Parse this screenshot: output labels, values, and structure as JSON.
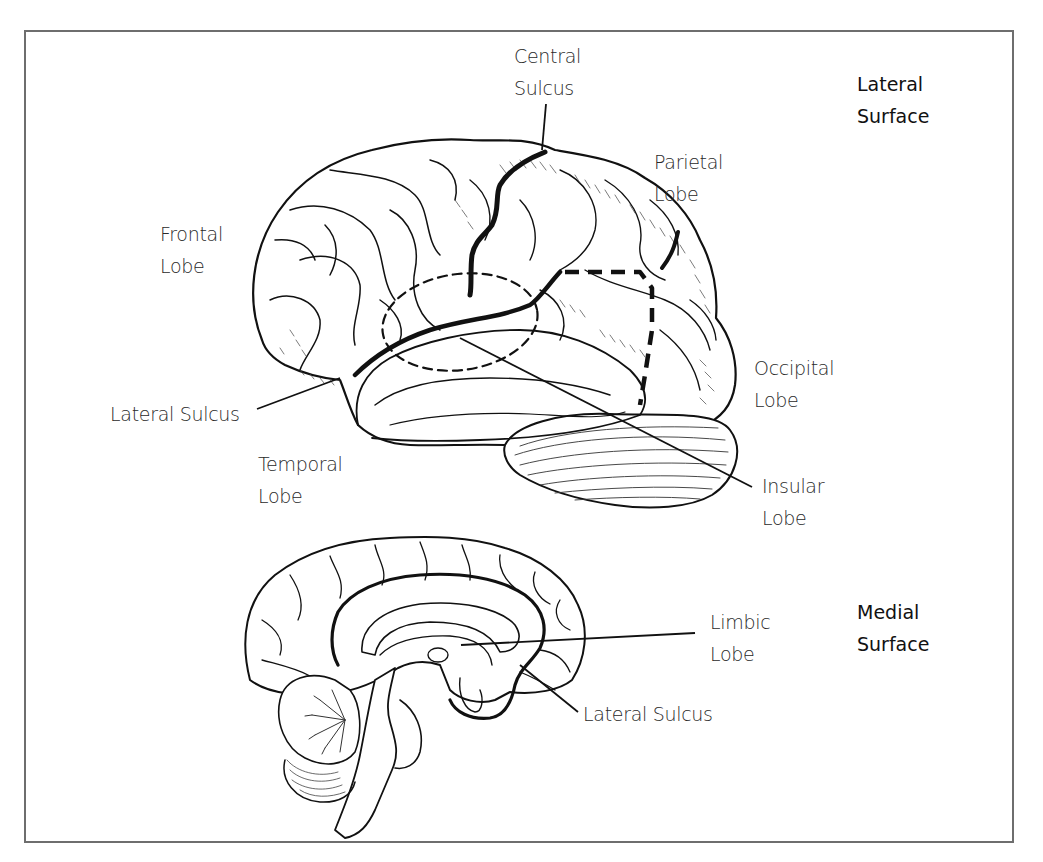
{
  "figure": {
    "lateral_heading": [
      "Lateral",
      "Surface"
    ],
    "medial_heading": [
      "Medial",
      "Surface"
    ]
  },
  "labels": {
    "central_sulcus": [
      "Central",
      "Sulcus"
    ],
    "parietal_lobe": [
      "Parietal",
      "Lobe"
    ],
    "frontal_lobe": [
      "Frontal",
      "Lobe"
    ],
    "occipital_lobe": [
      "Occipital",
      "Lobe"
    ],
    "lateral_sulcus_lateral": "Lateral Sulcus",
    "temporal_lobe": [
      "Temporal",
      "Lobe"
    ],
    "insular_lobe": [
      "Insular",
      "Lobe"
    ],
    "limbic_lobe": [
      "Limbic",
      "Lobe"
    ],
    "lateral_sulcus_medial": "Lateral Sulcus"
  },
  "colors": {
    "ink": "#111111",
    "frame": "#6e6e6e",
    "text": "#2a2a2a"
  }
}
